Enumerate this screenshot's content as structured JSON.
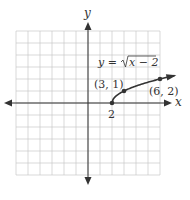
{
  "chart_data": {
    "type": "line",
    "title": "",
    "equation_label": "y = √(x − 2)",
    "equation_parts": {
      "lhs": "y =",
      "radicand": "x − 2"
    },
    "xlabel": "x",
    "ylabel": "y",
    "xlim": [
      -6,
      6
    ],
    "ylim": [
      -6,
      6
    ],
    "grid": true,
    "grid_step": 1,
    "series": [
      {
        "name": "y = sqrt(x - 2)",
        "x": [
          2,
          3,
          6,
          7.2
        ],
        "y": [
          0,
          1,
          2,
          2.28
        ],
        "color": "#333333",
        "marked_points": [
          {
            "x": 2,
            "y": 0,
            "label": "2"
          },
          {
            "x": 3,
            "y": 1,
            "label": "(3, 1)"
          },
          {
            "x": 6,
            "y": 2,
            "label": "(6, 2)"
          }
        ]
      }
    ],
    "annotations": [
      "(3, 1)",
      "(6, 2)",
      "2"
    ]
  },
  "colors": {
    "grid": "#c8c8c8",
    "axis": "#333333",
    "curve": "#333333",
    "text": "#333333",
    "background": "#ffffff"
  }
}
